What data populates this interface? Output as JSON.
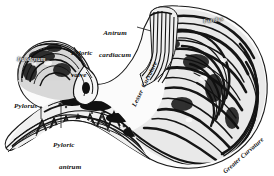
{
  "figure": {
    "style": "engraving",
    "background_color": "#ffffff",
    "ink_color": "#111111",
    "width": 274,
    "height": 176
  },
  "labels": {
    "antrum_cardiacum_line1": "Antrum",
    "antrum_cardiacum_line2": "cardiacum",
    "pyloric_valve_line1": "Pyloric",
    "pyloric_valve_line2": "valve",
    "duodenum": "Duodenum",
    "pylorus": "Pylorus",
    "pyloric_antrum_line1": "Pyloric",
    "pyloric_antrum_line2": "antrum",
    "lesser_curvature": "Lesser  Curvature",
    "greater_curvature": "Greater Curvature",
    "fundus": "Fundus"
  },
  "leaders": [
    {
      "name": "antrum-cardiacum-leader"
    },
    {
      "name": "pyloric-valve-leader-upper"
    },
    {
      "name": "pyloric-valve-leader-lower"
    },
    {
      "name": "pylorus-leader"
    },
    {
      "name": "pyloric-antrum-leader"
    }
  ]
}
